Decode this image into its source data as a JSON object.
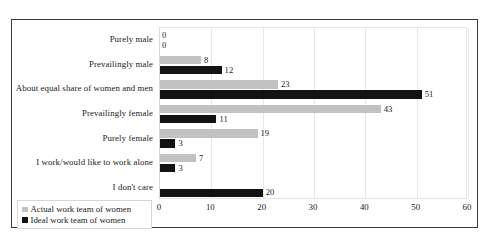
{
  "top_clipped_text": "",
  "chart_data": {
    "type": "bar",
    "orientation": "horizontal",
    "title": "",
    "subtitle": "",
    "xlabel": "",
    "ylabel": "",
    "xlim": [
      0,
      60
    ],
    "xticks": [
      0,
      10,
      20,
      30,
      40,
      50,
      60
    ],
    "grid": true,
    "legend_position": "bottom-left",
    "categories": [
      "Purely male",
      "Prevailingly male",
      "About equal share of women and men",
      "Prevailingly female",
      "Purely female",
      "I work/would like to work alone",
      "I don't care"
    ],
    "series": [
      {
        "name": "Actual work team of women",
        "color": "#c2c2c2",
        "values": [
          0,
          8,
          23,
          43,
          19,
          7,
          null
        ],
        "labels": [
          "0",
          "8",
          "23",
          "43",
          "19",
          "7",
          ""
        ]
      },
      {
        "name": "Ideal work team of women",
        "color": "#131313",
        "values": [
          0,
          12,
          51,
          11,
          3,
          3,
          20
        ],
        "labels": [
          "0",
          "12",
          "51",
          "11",
          "3",
          "3",
          "20"
        ]
      }
    ]
  },
  "legend": {
    "items": [
      {
        "label": "Actual work team of women",
        "color": "#c2c2c2"
      },
      {
        "label": "Ideal work team of women",
        "color": "#131313"
      }
    ]
  }
}
